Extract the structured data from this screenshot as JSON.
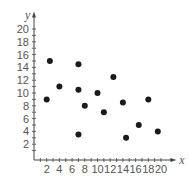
{
  "chart_data": {
    "type": "scatter",
    "title": "",
    "xlabel": "x",
    "ylabel": "y",
    "xlim": [
      0,
      21
    ],
    "ylim": [
      0,
      21
    ],
    "x_ticks": [
      2,
      4,
      6,
      8,
      10,
      12,
      14,
      16,
      18,
      20
    ],
    "y_ticks": [
      2,
      4,
      6,
      8,
      10,
      12,
      14,
      16,
      18,
      20
    ],
    "minor_tick_step": 1,
    "grid": false,
    "legend": null,
    "point_color": "#1a1a1a",
    "series": [
      {
        "name": "points",
        "points": [
          {
            "x": 2,
            "y": 9
          },
          {
            "x": 2.5,
            "y": 15
          },
          {
            "x": 4,
            "y": 11
          },
          {
            "x": 7,
            "y": 14.5
          },
          {
            "x": 7,
            "y": 10.5
          },
          {
            "x": 7,
            "y": 3.5
          },
          {
            "x": 8,
            "y": 8
          },
          {
            "x": 10,
            "y": 10
          },
          {
            "x": 11,
            "y": 7
          },
          {
            "x": 12.5,
            "y": 12.5
          },
          {
            "x": 14,
            "y": 8.5
          },
          {
            "x": 14.5,
            "y": 3
          },
          {
            "x": 16.5,
            "y": 5
          },
          {
            "x": 18,
            "y": 9
          },
          {
            "x": 19.5,
            "y": 4
          }
        ]
      }
    ]
  }
}
